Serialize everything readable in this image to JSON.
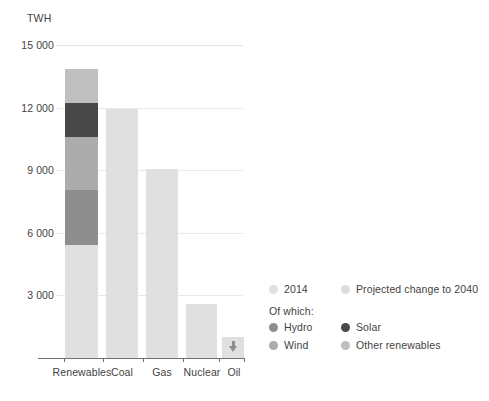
{
  "chart_data": {
    "type": "bar",
    "title": "",
    "subtitle": "",
    "xlabel": "",
    "ylabel": "TWH",
    "unit_label": "TWH",
    "ylim": [
      0,
      15000
    ],
    "yticks": [
      15000,
      12000,
      9000,
      6000,
      3000
    ],
    "ytick_labels": [
      "15 000",
      "12 000",
      "9 000",
      "6 000",
      "3 000"
    ],
    "grid": true,
    "legend_position": "right",
    "stacked": true,
    "categories": [
      "Renewables",
      "Coal",
      "Gas",
      "Nuclear",
      "Oil"
    ],
    "series": [
      {
        "name": "2014",
        "color": "#e0e0e0",
        "values": [
          5400,
          11950,
          9050,
          2600,
          1000
        ]
      },
      {
        "name": "Projected change to 2040",
        "color": "#dcdcdc",
        "values": [
          8400,
          0,
          0,
          0,
          -250
        ]
      }
    ],
    "renewables_breakdown": {
      "note": "Of which:",
      "segments": [
        {
          "name": "Hydro",
          "color": "#8e8e8e",
          "value": 2650
        },
        {
          "name": "Wind",
          "color": "#acacac",
          "value": 2550
        },
        {
          "name": "Solar",
          "color": "#484848",
          "value": 1600
        },
        {
          "name": "Other renewables",
          "color": "#bfbfbf",
          "value": 1650
        }
      ]
    },
    "bar_totals": [
      13800,
      11950,
      9050,
      2600,
      1000
    ],
    "annotations": [
      {
        "category": "Oil",
        "marker": "down-arrow",
        "meaning": "projected decline"
      }
    ]
  },
  "legend": {
    "row1": [
      {
        "label": "2014",
        "color": "#e0e0e0"
      },
      {
        "label": "Projected change to 2040",
        "color": "#dcdcdc"
      }
    ],
    "note": "Of which:",
    "row2": [
      {
        "label": "Hydro",
        "color": "#8e8e8e"
      },
      {
        "label": "Solar",
        "color": "#484848"
      }
    ],
    "row3": [
      {
        "label": "Wind",
        "color": "#acacac"
      },
      {
        "label": "Other renewables",
        "color": "#bfbfbf"
      }
    ]
  }
}
